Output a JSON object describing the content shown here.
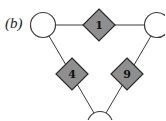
{
  "figure": {
    "panel_label": "(b)"
  },
  "nodes": {
    "circles": [
      {
        "id": "top-left",
        "cx": 43,
        "cy": 25,
        "r": 12.5
      },
      {
        "id": "top-right",
        "cx": 157,
        "cy": 25,
        "r": 12.5
      },
      {
        "id": "bottom",
        "cx": 100,
        "cy": 124,
        "r": 12.5
      }
    ],
    "diamonds": [
      {
        "id": "factor-top",
        "label": "1",
        "cx": 99,
        "cy": 25,
        "half": 16
      },
      {
        "id": "factor-left",
        "label": "4",
        "cx": 72,
        "cy": 74,
        "half": 16
      },
      {
        "id": "factor-right",
        "label": "9",
        "cx": 127,
        "cy": 74,
        "half": 16
      }
    ]
  },
  "colors": {
    "diamond_fill": "#8f8f8f",
    "stroke": "#3a3a3a",
    "circle_fill": "#ffffff"
  }
}
